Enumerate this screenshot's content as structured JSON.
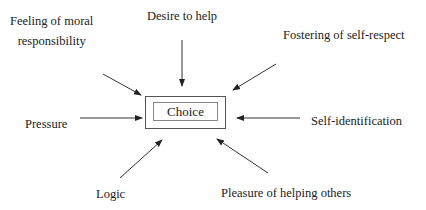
{
  "diagram": {
    "center": {
      "label": "Choice"
    },
    "factors": [
      {
        "id": "desire",
        "label": "Desire to help"
      },
      {
        "id": "moral",
        "lines": [
          "Feeling of moral",
          "responsibility"
        ]
      },
      {
        "id": "respect",
        "label": "Fostering of self-respect"
      },
      {
        "id": "pressure",
        "label": "Pressure"
      },
      {
        "id": "selfid",
        "label": "Self-identification"
      },
      {
        "id": "logic",
        "label": "Logic"
      },
      {
        "id": "pleasure",
        "label": "Pleasure of helping others"
      }
    ],
    "colors": {
      "line": "#333333",
      "text": "#222222",
      "background": "#ffffff"
    }
  }
}
